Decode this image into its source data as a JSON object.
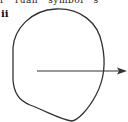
{
  "figure": {
    "top_text": "r   ruan   symbol   s",
    "label": "ii",
    "shape": "closed-curve",
    "arrow": "arrow-right",
    "colors": {
      "stroke": "#333333",
      "background": "#ffffff"
    }
  }
}
